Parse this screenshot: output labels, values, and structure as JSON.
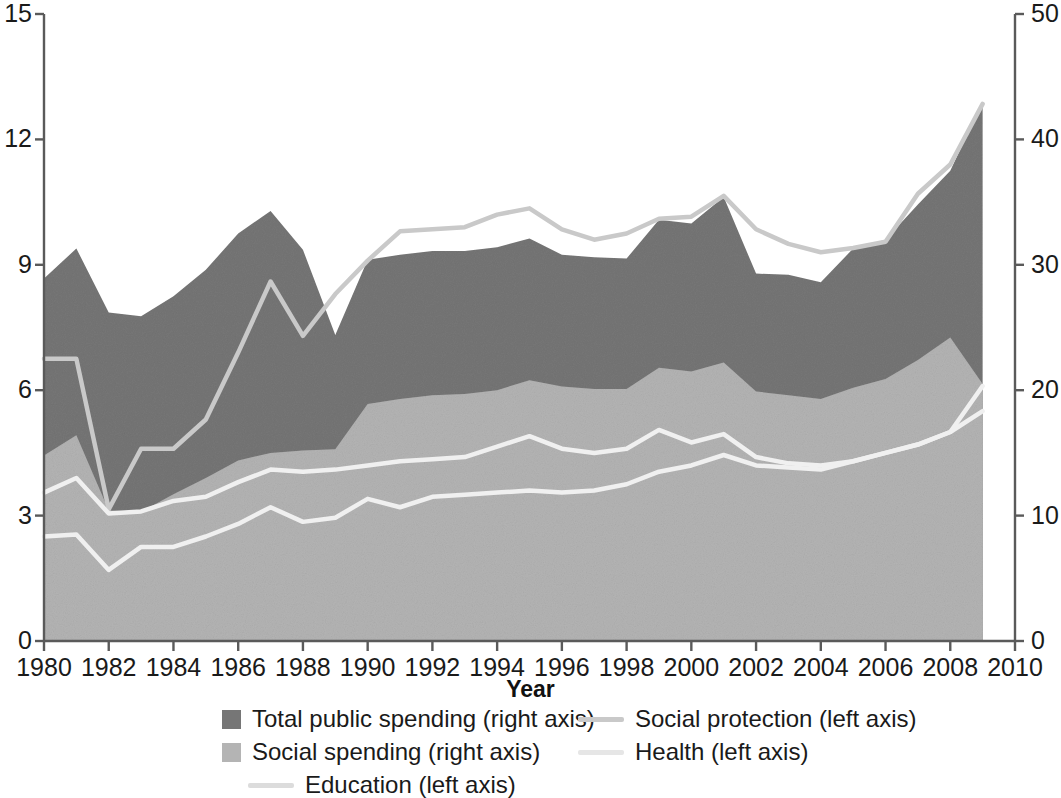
{
  "chart_data": {
    "type": "area",
    "title": "",
    "xlabel": "Year",
    "ylabel_left": "",
    "ylabel_right": "",
    "xlim": [
      1980,
      2010
    ],
    "xticks": [
      1980,
      1982,
      1984,
      1986,
      1988,
      1990,
      1992,
      1994,
      1996,
      1998,
      2000,
      2002,
      2004,
      2006,
      2008,
      2010
    ],
    "ylim_left": [
      0,
      15
    ],
    "yticks_left": [
      0,
      3,
      6,
      9,
      12,
      15
    ],
    "ylim_right": [
      0,
      50
    ],
    "yticks_right": [
      0,
      10,
      20,
      30,
      40,
      50
    ],
    "grid": false,
    "legend_position": "bottom",
    "x": [
      1980,
      1981,
      1982,
      1983,
      1984,
      1985,
      1986,
      1987,
      1988,
      1989,
      1990,
      1991,
      1992,
      1993,
      1994,
      1995,
      1996,
      1997,
      1998,
      1999,
      2000,
      2001,
      2002,
      2003,
      2004,
      2005,
      2006,
      2007,
      2008,
      2009
    ],
    "series": [
      {
        "name": "Total public spending (right axis)",
        "axis": "right",
        "render": "area",
        "color": "#767676",
        "values": [
          28.9,
          31.3,
          26.2,
          25.9,
          27.5,
          29.6,
          32.5,
          34.3,
          31.2,
          24.4,
          30.4,
          30.8,
          31.1,
          31.1,
          31.4,
          32.1,
          30.8,
          30.6,
          30.5,
          33.6,
          33.3,
          35.4,
          29.3,
          29.2,
          28.6,
          31.3,
          32.0,
          34.8,
          37.5,
          43.0
        ]
      },
      {
        "name": "Social spending (right axis)",
        "axis": "right",
        "render": "area",
        "color": "#b4b4b4",
        "values": [
          14.8,
          16.4,
          10.4,
          10.3,
          11.7,
          13.0,
          14.4,
          15.0,
          15.2,
          15.3,
          18.9,
          19.3,
          19.6,
          19.7,
          20.0,
          20.8,
          20.3,
          20.1,
          20.1,
          21.8,
          21.5,
          22.2,
          19.9,
          19.6,
          19.3,
          20.2,
          20.9,
          22.4,
          24.2,
          20.5
        ]
      },
      {
        "name": "Social protection (left axis)",
        "axis": "left",
        "render": "line",
        "color": "#c9c9c9",
        "values": [
          6.75,
          6.75,
          3.15,
          4.6,
          4.6,
          5.3,
          6.9,
          8.6,
          7.3,
          8.3,
          9.1,
          9.8,
          9.85,
          9.9,
          10.2,
          10.35,
          9.85,
          9.6,
          9.75,
          10.1,
          10.15,
          10.65,
          9.85,
          9.5,
          9.3,
          9.4,
          9.55,
          10.7,
          11.4,
          12.85
        ]
      },
      {
        "name": "Education (left axis)",
        "axis": "left",
        "render": "line",
        "color": "#f0f0f0",
        "values": [
          3.55,
          3.9,
          3.05,
          3.1,
          3.35,
          3.45,
          3.8,
          4.1,
          4.05,
          4.1,
          4.2,
          4.3,
          4.35,
          4.4,
          4.65,
          4.9,
          4.6,
          4.5,
          4.6,
          5.05,
          4.75,
          4.95,
          4.4,
          4.25,
          4.2,
          4.3,
          4.5,
          4.7,
          5.0,
          6.1
        ]
      },
      {
        "name": "Health (left axis)",
        "axis": "left",
        "render": "line",
        "color": "#f0f0f0",
        "values": [
          2.5,
          2.55,
          1.7,
          2.25,
          2.25,
          2.5,
          2.8,
          3.2,
          2.85,
          2.95,
          3.4,
          3.2,
          3.45,
          3.5,
          3.55,
          3.6,
          3.55,
          3.6,
          3.75,
          4.05,
          4.2,
          4.45,
          4.2,
          4.15,
          4.1,
          4.3,
          4.5,
          4.7,
          5.0,
          5.5
        ]
      }
    ]
  },
  "legend": {
    "items": [
      {
        "label": "Total public spending (right axis)",
        "marker": "square",
        "color": "#767676"
      },
      {
        "label": "Social spending (right axis)",
        "marker": "square",
        "color": "#b4b4b4"
      },
      {
        "label": "Education (left axis)",
        "marker": "line",
        "color": "#dcdcdc"
      },
      {
        "label": "Social protection (left axis)",
        "marker": "line",
        "color": "#c9c9c9"
      },
      {
        "label": "Health (left axis)",
        "marker": "line",
        "color": "#e6e6e6"
      }
    ]
  },
  "axes": {
    "x_title": "Year",
    "x_tick_labels": [
      "1980",
      "1982",
      "1984",
      "1986",
      "1988",
      "1990",
      "1992",
      "1994",
      "1996",
      "1998",
      "2000",
      "2002",
      "2004",
      "2006",
      "2008",
      "2010"
    ],
    "y_left_tick_labels": [
      "15",
      "12",
      "9",
      "6",
      "3",
      "0"
    ],
    "y_right_tick_labels": [
      "50",
      "40",
      "30",
      "20",
      "10",
      "0"
    ]
  },
  "colors": {
    "total_public_spending": "#767676",
    "social_spending": "#b4b4b4",
    "line_light": "#f0f0f0",
    "line_gray": "#c9c9c9",
    "axis": "#5a5a5a",
    "text": "#1a1a1a"
  }
}
